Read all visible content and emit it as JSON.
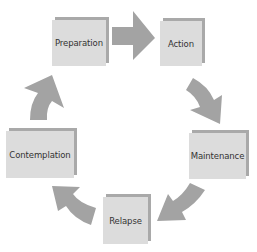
{
  "diagram": {
    "type": "cycle",
    "stages": [
      {
        "id": "preparation",
        "label": "Preparation"
      },
      {
        "id": "action",
        "label": "Action"
      },
      {
        "id": "maintenance",
        "label": "Maintenance"
      },
      {
        "id": "relapse",
        "label": "Relapse"
      },
      {
        "id": "contemplation",
        "label": "Contemplation"
      }
    ],
    "flow": [
      {
        "from": "Preparation",
        "to": "Action"
      },
      {
        "from": "Action",
        "to": "Maintenance"
      },
      {
        "from": "Maintenance",
        "to": "Relapse"
      },
      {
        "from": "Relapse",
        "to": "Contemplation"
      },
      {
        "from": "Contemplation",
        "to": "Preparation"
      }
    ],
    "colors": {
      "box_face": "#dcdcdc",
      "box_shadow": "#a9a9a9",
      "arrow": "#a3a3a3",
      "text": "#333333"
    }
  }
}
